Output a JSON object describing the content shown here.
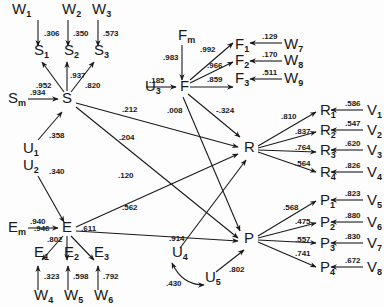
{
  "diagram": {
    "type": "path-diagram",
    "nodes": [
      {
        "id": "W1",
        "base": "W",
        "sub": "1",
        "x": 12,
        "y": 14
      },
      {
        "id": "W2",
        "base": "W",
        "sub": "2",
        "x": 62,
        "y": 14
      },
      {
        "id": "W3",
        "base": "W",
        "sub": "3",
        "x": 92,
        "y": 14
      },
      {
        "id": "S1",
        "base": "S",
        "sub": "1",
        "x": 34,
        "y": 55
      },
      {
        "id": "S2",
        "base": "S",
        "sub": "2",
        "x": 64,
        "y": 55
      },
      {
        "id": "S3",
        "base": "S",
        "sub": "3",
        "x": 94,
        "y": 55
      },
      {
        "id": "Sm",
        "base": "S",
        "sub": "m",
        "x": 8,
        "y": 103
      },
      {
        "id": "S",
        "base": "S",
        "sub": "",
        "x": 62,
        "y": 103
      },
      {
        "id": "U1",
        "base": "U",
        "sub": "1",
        "x": 23,
        "y": 153
      },
      {
        "id": "U2",
        "base": "U",
        "sub": "2",
        "x": 23,
        "y": 170
      },
      {
        "id": "Em",
        "base": "E",
        "sub": "m",
        "x": 8,
        "y": 232
      },
      {
        "id": "E",
        "base": "E",
        "sub": "",
        "x": 62,
        "y": 232
      },
      {
        "id": "E1",
        "base": "E",
        "sub": "1",
        "x": 34,
        "y": 257
      },
      {
        "id": "E2",
        "base": "E",
        "sub": "2",
        "x": 64,
        "y": 257
      },
      {
        "id": "E3",
        "base": "E",
        "sub": "3",
        "x": 94,
        "y": 257
      },
      {
        "id": "W4",
        "base": "W",
        "sub": "4",
        "x": 34,
        "y": 300
      },
      {
        "id": "W5",
        "base": "W",
        "sub": "5",
        "x": 64,
        "y": 300
      },
      {
        "id": "W6",
        "base": "W",
        "sub": "6",
        "x": 94,
        "y": 300
      },
      {
        "id": "Fm",
        "base": "F",
        "sub": "m",
        "x": 178,
        "y": 40
      },
      {
        "id": "U3",
        "base": "U",
        "sub": "3",
        "x": 145,
        "y": 91
      },
      {
        "id": "F",
        "base": "F",
        "sub": "",
        "x": 180,
        "y": 91
      },
      {
        "id": "F1",
        "base": "F",
        "sub": "1",
        "x": 235,
        "y": 49
      },
      {
        "id": "F2",
        "base": "F",
        "sub": "2",
        "x": 235,
        "y": 65
      },
      {
        "id": "F3",
        "base": "F",
        "sub": "3",
        "x": 235,
        "y": 83
      },
      {
        "id": "W7",
        "base": "W",
        "sub": "7",
        "x": 284,
        "y": 49
      },
      {
        "id": "W8",
        "base": "W",
        "sub": "8",
        "x": 284,
        "y": 65
      },
      {
        "id": "W9",
        "base": "W",
        "sub": "9",
        "x": 284,
        "y": 83
      },
      {
        "id": "R",
        "base": "R",
        "sub": "",
        "x": 244,
        "y": 152
      },
      {
        "id": "P",
        "base": "P",
        "sub": "",
        "x": 244,
        "y": 243
      },
      {
        "id": "U4",
        "base": "U",
        "sub": "4",
        "x": 172,
        "y": 257
      },
      {
        "id": "U5",
        "base": "U",
        "sub": "5",
        "x": 205,
        "y": 282
      },
      {
        "id": "R1",
        "base": "R",
        "sub": "1",
        "x": 320,
        "y": 115
      },
      {
        "id": "R2",
        "base": "R",
        "sub": "2",
        "x": 320,
        "y": 135
      },
      {
        "id": "R3",
        "base": "R",
        "sub": "3",
        "x": 320,
        "y": 155
      },
      {
        "id": "R4",
        "base": "R",
        "sub": "4",
        "x": 320,
        "y": 177
      },
      {
        "id": "V1",
        "base": "V",
        "sub": "1",
        "x": 367,
        "y": 115
      },
      {
        "id": "V2",
        "base": "V",
        "sub": "2",
        "x": 367,
        "y": 135
      },
      {
        "id": "V3",
        "base": "V",
        "sub": "3",
        "x": 367,
        "y": 155
      },
      {
        "id": "V4",
        "base": "V",
        "sub": "4",
        "x": 367,
        "y": 177
      },
      {
        "id": "P1",
        "base": "P",
        "sub": "1",
        "x": 320,
        "y": 205
      },
      {
        "id": "P2",
        "base": "P",
        "sub": "2",
        "x": 320,
        "y": 227
      },
      {
        "id": "P3",
        "base": "P",
        "sub": "3",
        "x": 320,
        "y": 248
      },
      {
        "id": "P4",
        "base": "P",
        "sub": "4",
        "x": 320,
        "y": 272
      },
      {
        "id": "V5",
        "base": "V",
        "sub": "5",
        "x": 367,
        "y": 205
      },
      {
        "id": "V6",
        "base": "V",
        "sub": "6",
        "x": 367,
        "y": 227
      },
      {
        "id": "V7",
        "base": "V",
        "sub": "7",
        "x": 367,
        "y": 248
      },
      {
        "id": "V8",
        "base": "V",
        "sub": "8",
        "x": 367,
        "y": 272
      }
    ],
    "edges": [
      {
        "from": "W1",
        "to": "S1",
        "coef": ".306",
        "x1": 38,
        "y1": 20,
        "x2": 38,
        "y2": 46,
        "lx": 44,
        "ly": 36
      },
      {
        "from": "W2",
        "to": "S2",
        "coef": ".350",
        "x1": 68,
        "y1": 20,
        "x2": 68,
        "y2": 46,
        "lx": 73,
        "ly": 36
      },
      {
        "from": "W3",
        "to": "S3",
        "coef": ".573",
        "x1": 98,
        "y1": 20,
        "x2": 98,
        "y2": 46,
        "lx": 103,
        "ly": 36
      },
      {
        "from": "S",
        "to": "S1",
        "coef": ".952",
        "x1": 64,
        "y1": 92,
        "x2": 42,
        "y2": 62,
        "lx": 36,
        "ly": 88
      },
      {
        "from": "S",
        "to": "S2",
        "coef": ".937",
        "x1": 67,
        "y1": 91,
        "x2": 67,
        "y2": 62,
        "lx": 70,
        "ly": 78
      },
      {
        "from": "S",
        "to": "S3",
        "coef": ".820",
        "x1": 71,
        "y1": 92,
        "x2": 94,
        "y2": 62,
        "lx": 85,
        "ly": 88
      },
      {
        "from": "Sm",
        "to": "S",
        "coef": ".934",
        "x1": 28,
        "y1": 99,
        "x2": 58,
        "y2": 99,
        "lx": 30,
        "ly": 95
      },
      {
        "from": "U1",
        "to": "S",
        "coef": ".358",
        "x1": 38,
        "y1": 140,
        "x2": 62,
        "y2": 112,
        "lx": 49,
        "ly": 138
      },
      {
        "from": "U2",
        "to": "E",
        "coef": ".340",
        "x1": 38,
        "y1": 176,
        "x2": 64,
        "y2": 222,
        "lx": 49,
        "ly": 174
      },
      {
        "from": "Em",
        "to": "E",
        "coef": ".940",
        "x1": 28,
        "y1": 228,
        "x2": 58,
        "y2": 228,
        "lx": 30,
        "ly": 224
      },
      {
        "from": "E",
        "to": "E1",
        "coef": ".946",
        "x1": 63,
        "y1": 236,
        "x2": 42,
        "y2": 260,
        "lx": 34,
        "ly": 231
      },
      {
        "from": "E",
        "to": "E2",
        "coef": ".802",
        "x1": 67,
        "y1": 236,
        "x2": 67,
        "y2": 260,
        "lx": 47,
        "ly": 242
      },
      {
        "from": "E",
        "to": "E3",
        "coef": ".611",
        "x1": 71,
        "y1": 236,
        "x2": 94,
        "y2": 260,
        "lx": 81,
        "ly": 231
      },
      {
        "from": "W4",
        "to": "E1",
        "coef": ".323",
        "x1": 38,
        "y1": 290,
        "x2": 38,
        "y2": 266,
        "lx": 44,
        "ly": 279
      },
      {
        "from": "W5",
        "to": "E2",
        "coef": ".598",
        "x1": 68,
        "y1": 290,
        "x2": 68,
        "y2": 266,
        "lx": 73,
        "ly": 279
      },
      {
        "from": "W6",
        "to": "E3",
        "coef": ".792",
        "x1": 98,
        "y1": 290,
        "x2": 98,
        "y2": 266,
        "lx": 103,
        "ly": 279
      },
      {
        "from": "S",
        "to": "R",
        "coef": ".212",
        "x1": 76,
        "y1": 103,
        "x2": 238,
        "y2": 147,
        "lx": 122,
        "ly": 112
      },
      {
        "from": "S",
        "to": "P",
        "coef": ".204",
        "x1": 76,
        "y1": 107,
        "x2": 238,
        "y2": 238,
        "lx": 119,
        "ly": 140
      },
      {
        "from": "E",
        "to": "R",
        "coef": ".120",
        "x1": 76,
        "y1": 227,
        "x2": 238,
        "y2": 154,
        "lx": 118,
        "ly": 178
      },
      {
        "from": "E",
        "to": "P",
        "coef": ".562",
        "x1": 76,
        "y1": 231,
        "x2": 238,
        "y2": 241,
        "lx": 122,
        "ly": 210
      },
      {
        "from": "Fm",
        "to": "F",
        "coef": ".983",
        "x1": 182,
        "y1": 45,
        "x2": 182,
        "y2": 80,
        "lx": 163,
        "ly": 60
      },
      {
        "from": "U3",
        "to": "F",
        "coef": ".185",
        "x1": 146,
        "y1": 87,
        "x2": 176,
        "y2": 87,
        "lx": 149,
        "ly": 83
      },
      {
        "from": "F",
        "to": "F1",
        "coef": ".992",
        "x1": 190,
        "y1": 80,
        "x2": 233,
        "y2": 43,
        "lx": 200,
        "ly": 52
      },
      {
        "from": "F",
        "to": "F2",
        "coef": ".966",
        "x1": 190,
        "y1": 83,
        "x2": 233,
        "y2": 62,
        "lx": 207,
        "ly": 68
      },
      {
        "from": "F",
        "to": "F3",
        "coef": ".859",
        "x1": 190,
        "y1": 87,
        "x2": 233,
        "y2": 87,
        "lx": 207,
        "ly": 82
      },
      {
        "from": "W7",
        "to": "F1",
        "coef": ".129",
        "x1": 282,
        "y1": 43,
        "x2": 250,
        "y2": 43,
        "lx": 262,
        "ly": 39
      },
      {
        "from": "W8",
        "to": "F2",
        "coef": ".170",
        "x1": 282,
        "y1": 61,
        "x2": 250,
        "y2": 61,
        "lx": 262,
        "ly": 57
      },
      {
        "from": "W9",
        "to": "F3",
        "coef": ".511",
        "x1": 282,
        "y1": 79,
        "x2": 250,
        "y2": 79,
        "lx": 262,
        "ly": 75
      },
      {
        "from": "F",
        "to": "R",
        "coef": "-.324",
        "x1": 188,
        "y1": 94,
        "x2": 240,
        "y2": 137,
        "lx": 216,
        "ly": 113
      },
      {
        "from": "F",
        "to": "P",
        "coef": ".008",
        "x1": 183,
        "y1": 97,
        "x2": 240,
        "y2": 231,
        "lx": 167,
        "ly": 113
      },
      {
        "from": "U4",
        "to": "R",
        "coef": ".914",
        "x1": 180,
        "y1": 248,
        "x2": 246,
        "y2": 160,
        "lx": 169,
        "ly": 241
      },
      {
        "from": "U5",
        "to": "P",
        "coef": ".802",
        "x1": 216,
        "y1": 272,
        "x2": 244,
        "y2": 250,
        "lx": 229,
        "ly": 272
      },
      {
        "from": "R",
        "to": "R1",
        "coef": ".810",
        "x1": 258,
        "y1": 146,
        "x2": 316,
        "y2": 112,
        "lx": 281,
        "ly": 119
      },
      {
        "from": "R",
        "to": "R2",
        "coef": ".837",
        "x1": 258,
        "y1": 148,
        "x2": 316,
        "y2": 132,
        "lx": 295,
        "ly": 134
      },
      {
        "from": "R",
        "to": "R3",
        "coef": ".764",
        "x1": 258,
        "y1": 150,
        "x2": 316,
        "y2": 152,
        "lx": 295,
        "ly": 150
      },
      {
        "from": "R",
        "to": "R4",
        "coef": ".564",
        "x1": 258,
        "y1": 152,
        "x2": 316,
        "y2": 172,
        "lx": 295,
        "ly": 166
      },
      {
        "from": "V1",
        "to": "R1",
        "coef": ".586",
        "x1": 363,
        "y1": 110,
        "x2": 331,
        "y2": 110,
        "lx": 345,
        "ly": 106
      },
      {
        "from": "V2",
        "to": "R2",
        "coef": ".547",
        "x1": 363,
        "y1": 130,
        "x2": 331,
        "y2": 130,
        "lx": 345,
        "ly": 126
      },
      {
        "from": "V3",
        "to": "R3",
        "coef": ".620",
        "x1": 363,
        "y1": 150,
        "x2": 331,
        "y2": 150,
        "lx": 345,
        "ly": 146
      },
      {
        "from": "V4",
        "to": "R4",
        "coef": ".826",
        "x1": 363,
        "y1": 172,
        "x2": 331,
        "y2": 172,
        "lx": 345,
        "ly": 168
      },
      {
        "from": "P",
        "to": "P1",
        "coef": ".568",
        "x1": 258,
        "y1": 236,
        "x2": 316,
        "y2": 201,
        "lx": 283,
        "ly": 210
      },
      {
        "from": "P",
        "to": "P2",
        "coef": ".475",
        "x1": 258,
        "y1": 238,
        "x2": 316,
        "y2": 223,
        "lx": 295,
        "ly": 224
      },
      {
        "from": "P",
        "to": "P3",
        "coef": ".557",
        "x1": 258,
        "y1": 240,
        "x2": 316,
        "y2": 243,
        "lx": 295,
        "ly": 242
      },
      {
        "from": "P",
        "to": "P4",
        "coef": ".741",
        "x1": 258,
        "y1": 242,
        "x2": 316,
        "y2": 267,
        "lx": 295,
        "ly": 256
      },
      {
        "from": "V5",
        "to": "P1",
        "coef": ".823",
        "x1": 363,
        "y1": 200,
        "x2": 331,
        "y2": 200,
        "lx": 345,
        "ly": 196
      },
      {
        "from": "V6",
        "to": "P2",
        "coef": ".880",
        "x1": 363,
        "y1": 222,
        "x2": 331,
        "y2": 222,
        "lx": 345,
        "ly": 218
      },
      {
        "from": "V7",
        "to": "P3",
        "coef": ".830",
        "x1": 363,
        "y1": 243,
        "x2": 331,
        "y2": 243,
        "lx": 345,
        "ly": 239
      },
      {
        "from": "V8",
        "to": "P4",
        "coef": ".672",
        "x1": 363,
        "y1": 267,
        "x2": 331,
        "y2": 267,
        "lx": 345,
        "ly": 263
      }
    ],
    "correlations": [
      {
        "from": "U4",
        "to": "U5",
        "coef": ".430",
        "path": "M 172 263 Q 182 285 204 285",
        "lx": 166,
        "ly": 286
      }
    ]
  }
}
